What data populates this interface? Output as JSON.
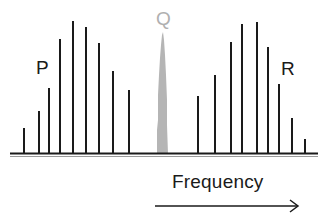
{
  "labels": {
    "p": "P",
    "q": "Q",
    "r": "R",
    "axis": "Frequency"
  },
  "colors": {
    "lines": "#1a1a1a",
    "central_peak": "#b5b5b5",
    "baseline": "#1a1a1a"
  },
  "chart_data": {
    "type": "bar",
    "title": "",
    "xlabel": "Frequency",
    "ylabel": "",
    "series": [
      {
        "name": "P",
        "x": [
          24,
          39,
          49,
          60,
          73,
          86,
          99,
          113,
          129
        ],
        "top": [
          128,
          111,
          88,
          39,
          21,
          27,
          43,
          71,
          90
        ]
      },
      {
        "name": "Q",
        "x": [
          162
        ],
        "top": [
          32
        ]
      },
      {
        "name": "R",
        "x": [
          198,
          215,
          231,
          242,
          257,
          268,
          279,
          292,
          305
        ],
        "top": [
          96,
          75,
          42,
          24,
          22,
          47,
          84,
          118,
          139
        ]
      }
    ],
    "baseline_y": 154
  }
}
